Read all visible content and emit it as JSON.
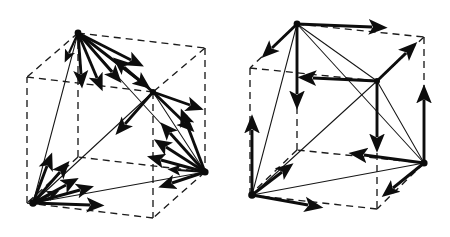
{
  "figure": {
    "background_color": "#ffffff",
    "ink_color": "#111111",
    "width": 450,
    "height": 237,
    "panel_count": 2,
    "caption_left": "",
    "caption_right": ""
  },
  "panels": [
    {
      "id": "panel-left",
      "name": "left-cube-diagram",
      "label": "",
      "description": "Dashed cube wireframe with inscribed tetrahedron; fans of bold arrows radiate from each tetrahedron vertex",
      "cube": {
        "style": "dashed",
        "dash_pattern": "7 5",
        "stroke_width": 1.35,
        "color": "#1b1b1b",
        "vertices": {
          "front_top_left": [
            78,
            33
          ],
          "front_top_right": [
            205,
            48
          ],
          "front_bottom_left": [
            33,
            203
          ],
          "front_bottom_right": [
            163,
            218
          ],
          "back_top_left": [
            27,
            77
          ],
          "back_top_right": [
            153,
            92
          ],
          "back_bottom_left": [
            27,
            195
          ],
          "back_bottom_right": [
            205,
            172
          ]
        }
      },
      "tetrahedron": {
        "style": "solid",
        "stroke_width": 1.05,
        "color": "#161616",
        "vertex_names": [
          "top",
          "center",
          "bottom-left",
          "right"
        ],
        "vertices": {
          "top": [
            78,
            33
          ],
          "center": [
            153,
            92
          ],
          "bottom_left": [
            33,
            203
          ],
          "right": [
            205,
            172
          ]
        }
      },
      "arrow_fans": [
        {
          "name": "arrow-fan-top",
          "origin": [
            78,
            33
          ],
          "arrow_count": 6,
          "direction_summary": "fan spreading down and to the right, plus one short arrow straight down"
        },
        {
          "name": "arrow-fan-center",
          "origin": [
            153,
            92
          ],
          "arrow_count": 4,
          "direction_summary": "arrows radiating up-left, down-left, down-right and right"
        },
        {
          "name": "arrow-fan-bottom-left",
          "origin": [
            33,
            203
          ],
          "arrow_count": 6,
          "direction_summary": "fan spreading up and to the right, plus one arrow horizontally right"
        },
        {
          "name": "arrow-fan-right",
          "origin": [
            205,
            172
          ],
          "arrow_count": 6,
          "direction_summary": "fan spreading up-left and left, plus one arrow down-left"
        }
      ]
    },
    {
      "id": "panel-right",
      "name": "right-cube-diagram",
      "label": "",
      "description": "Dashed cube wireframe with inscribed tetrahedron; bold axis-aligned arrows at each tetrahedron vertex",
      "cube": {
        "style": "dashed",
        "dash_pattern": "7 5",
        "stroke_width": 1.35,
        "color": "#1b1b1b",
        "vertices": {
          "front_top_left": [
            297,
            24
          ],
          "front_top_right": [
            424,
            37
          ],
          "front_bottom_left": [
            252,
            195
          ],
          "front_bottom_right": [
            381,
            209
          ],
          "back_top_left": [
            250,
            68
          ],
          "back_top_right": [
            377,
            81
          ],
          "back_bottom_left": [
            250,
            185
          ],
          "back_bottom_right": [
            424,
            163
          ]
        }
      },
      "tetrahedron": {
        "style": "solid",
        "stroke_width": 1.05,
        "color": "#161616",
        "vertex_names": [
          "top",
          "center",
          "bottom-left",
          "right"
        ],
        "vertices": {
          "top": [
            297,
            24
          ],
          "center": [
            377,
            81
          ],
          "bottom_left": [
            252,
            195
          ],
          "right": [
            424,
            163
          ]
        }
      },
      "arrow_fans": [
        {
          "name": "arrow-fan-top",
          "origin": [
            297,
            24
          ],
          "arrow_count": 3,
          "direction_summary": "arrow right along top edge, arrow straight down, short arrow up-left"
        },
        {
          "name": "arrow-fan-center",
          "origin": [
            377,
            81
          ],
          "arrow_count": 3,
          "direction_summary": "arrow up-right, arrow left, arrow straight down"
        },
        {
          "name": "arrow-fan-bottom-left",
          "origin": [
            252,
            195
          ],
          "arrow_count": 3,
          "direction_summary": "arrow straight up, arrow right, short arrow up-right"
        },
        {
          "name": "arrow-fan-right",
          "origin": [
            424,
            163
          ],
          "arrow_count": 3,
          "direction_summary": "arrow straight up, arrow left, short arrow down-left"
        }
      ]
    }
  ]
}
